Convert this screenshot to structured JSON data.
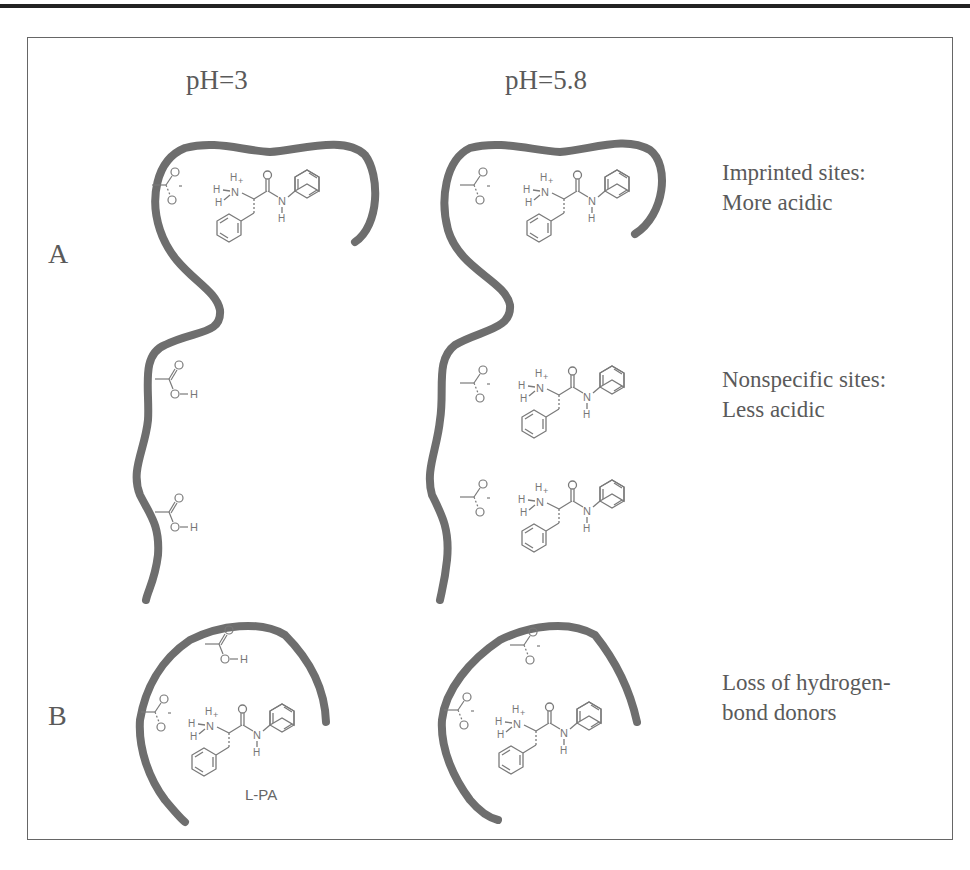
{
  "columns": {
    "left_header": "pH=3",
    "right_header": "pH=5.8"
  },
  "panels": {
    "a_label": "A",
    "b_label": "B"
  },
  "annotations": {
    "imprinted_line1": "Imprinted sites:",
    "imprinted_line2": "More acidic",
    "nonspecific_line1": "Nonspecific sites:",
    "nonspecific_line2": "Less acidic",
    "loss_line1": "Loss of hydrogen-",
    "loss_line2": "bond donors"
  },
  "molecule_label": "L-PA",
  "chem": {
    "carboxylic_acid": "O-H",
    "hydrogen": "H",
    "nitrogen": "N",
    "oxygen": "O",
    "ammonium_charge": "+",
    "carboxylate_charge": "-"
  },
  "colors": {
    "polymer": "#6e6e6e",
    "molecule": "#7a7a7a",
    "text": "#5a5a5a",
    "frame": "#666666"
  }
}
